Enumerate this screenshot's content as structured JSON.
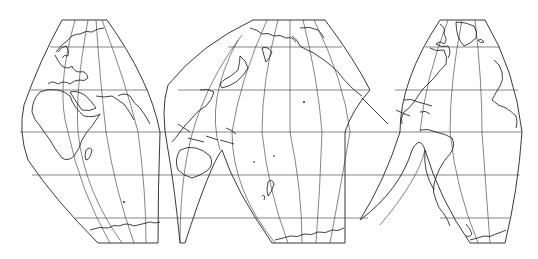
{
  "map": {
    "type": "interrupted-world-projection",
    "background": "#ffffff",
    "line_color": "#222222",
    "lobes": [
      {
        "name": "eurasia-africa-lobe",
        "regions": [
          "Europe",
          "Asia",
          "Africa",
          "Madagascar",
          "Antarctica"
        ]
      },
      {
        "name": "pacific-lobe",
        "regions": [
          "Siberia",
          "Alaska",
          "Japan",
          "Southeast Asia",
          "Australia",
          "New Zealand",
          "Antarctica"
        ]
      },
      {
        "name": "americas-lobe",
        "regions": [
          "Greenland",
          "North America",
          "Caribbean",
          "South America",
          "West Africa coast",
          "Antarctica"
        ]
      }
    ],
    "graticule": {
      "parallels_y": [
        47,
        90,
        132,
        175,
        218
      ],
      "equator_y": 132,
      "top_edge_y": 20,
      "bottom_edge_y": 243
    }
  }
}
